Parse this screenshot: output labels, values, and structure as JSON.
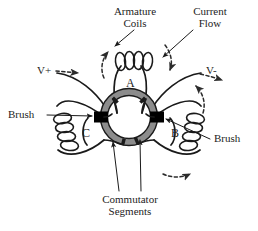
{
  "figure": {
    "colors": {
      "wire": "#1a1a1a",
      "commutator_ring": "#8c8c8c",
      "ring_outline": "#1a1a1a",
      "brush": "#000000",
      "background": "#ffffff",
      "text": "#1d1d1d",
      "dashed_arrow": "#333333"
    }
  },
  "callouts": {
    "armature_coils": "Armature\nCoils",
    "current_flow": "Current\nFlow",
    "brush_left": "Brush",
    "brush_right": "Brush",
    "commutator_segments": "Commutator\nSegments"
  },
  "terminals": {
    "positive": "V+",
    "negative": "V-"
  },
  "coils": [
    {
      "id": "A",
      "label": "A",
      "position": "top"
    },
    {
      "id": "B",
      "label": "B",
      "position": "right"
    },
    {
      "id": "C",
      "label": "C",
      "position": "left"
    }
  ]
}
